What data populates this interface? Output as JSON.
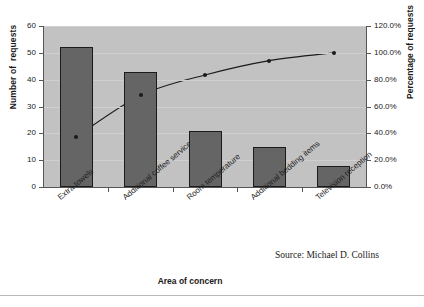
{
  "chart_data": {
    "type": "bar",
    "chart_kind": "pareto",
    "title": "",
    "subtitle": "",
    "xlabel": "Area of concern",
    "ylabel": "Number of  requests",
    "y2label": "Percentage of requests",
    "categories": [
      "Extra towels",
      "Additional coffee service",
      "Room temperature",
      "Additional bedding items",
      "Television reception"
    ],
    "series": [
      {
        "name": "Number of requests",
        "kind": "bar",
        "axis": "left",
        "values": [
          52,
          43,
          21,
          15,
          8
        ]
      },
      {
        "name": "Cumulative percentage of requests",
        "kind": "line",
        "axis": "right",
        "values": [
          37.4,
          68.3,
          83.5,
          94.2,
          100.0
        ],
        "value_labels": [
          "37.4%",
          "68.3%",
          "83.5%",
          "94.2%",
          "100.0%"
        ]
      }
    ],
    "total_requests": 139,
    "ylim": [
      0,
      60
    ],
    "y2lim": [
      0,
      120
    ],
    "yticks": [
      0,
      10,
      20,
      30,
      40,
      50,
      60
    ],
    "ytick_labels": [
      "0",
      "10",
      "20",
      "30",
      "40",
      "50",
      "60"
    ],
    "y2ticks": [
      0,
      20,
      40,
      60,
      80,
      100,
      120
    ],
    "y2tick_labels": [
      "0.0%",
      "20.0%",
      "40.0%",
      "60.0%",
      "80.0%",
      "100.0%",
      "120.0%"
    ],
    "grid": true,
    "legend": false,
    "legend_position": "none",
    "plot_background": "#c2c2c2",
    "bar_color": "#656565",
    "bar_edge_color": "#1b1b1b",
    "line_color": "#1b1b1b",
    "marker_color": "#1b1b1b",
    "annotations": [
      {
        "name": "source-note",
        "text": "Source: Michael D. Collins"
      }
    ]
  },
  "figure": {
    "source_note": "Source: Michael D. Collins",
    "footer_cut_text": ""
  }
}
